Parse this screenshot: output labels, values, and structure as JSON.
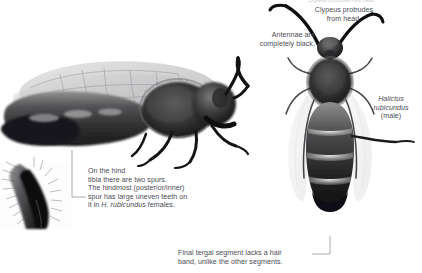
{
  "figure": {
    "background": "#ffffff",
    "text_color": "#4b4b55",
    "leader_color": "#7b7b86",
    "width": 422,
    "height": 273
  },
  "captions": {
    "spur": "On the hind\ntibia there are two spurs.\nThe hindmost (posterior/inner)\nspur has large uneven teeth on\nit in ",
    "spur_italic": "H. rubicundus",
    "spur_tail": " females.",
    "antennae": "Antennae are\ncompletely black.",
    "clypeus": "Clypeus protrudes\nfrom head.",
    "tergal": "Final tergal segment lacks a hair\nband, unlike the other segments.",
    "cut_top": "Clypeus protrudes from head."
  },
  "species_label": {
    "genus_species": "Halictus\nrubicundus",
    "sex": "(male)"
  },
  "specimens": [
    {
      "name": "lateral-female-bee",
      "view": "lateral",
      "description": "Halictus rubicundus female, side view with wings"
    },
    {
      "name": "dorsal-male-bee",
      "view": "dorsal",
      "description": "Halictus rubicundus male, top view with banded abdomen"
    },
    {
      "name": "hind-tibia-spur-inset",
      "view": "close-up",
      "description": "Close-up of hind tibia spurs"
    }
  ],
  "leaders": [
    {
      "name": "spur-leader",
      "from": "hind-tibia-spur-inset",
      "to": "spur-caption"
    },
    {
      "name": "tergal-leader",
      "from": "tergal-caption",
      "to": "dorsal-male-bee-abdomen-tip"
    }
  ]
}
